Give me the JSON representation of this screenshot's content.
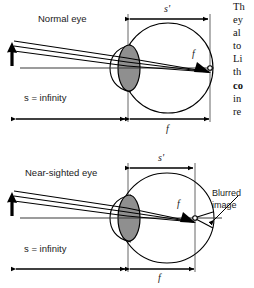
{
  "figure": {
    "type": "optics-diagram",
    "title_absent": true,
    "background_color": "#ffffff",
    "line_color": "#000000",
    "lens_fill_color": "#8c8c8c",
    "dimension_line_color": "#000000",
    "axis_color": "#3a3a3a"
  },
  "panels": [
    {
      "id": "normal-eye",
      "label": "Normal eye",
      "object_distance_label": "s = infinity",
      "image_distance_label": "s'",
      "focal_label_top": "f",
      "focal_label_bottom": "f",
      "focus_on_retina": true,
      "annotation": null
    },
    {
      "id": "near-sighted-eye",
      "label": "Near-sighted eye",
      "object_distance_label": "s = infinity",
      "image_distance_label": "s'",
      "focal_label_top": "f",
      "focal_label_bottom": "f",
      "focus_on_retina": false,
      "annotation": "Blurred\nimage",
      "annotation_line1": "Blurred",
      "annotation_line2": "image"
    }
  ],
  "side_text": {
    "lines": [
      {
        "text": "Th",
        "bold": false
      },
      {
        "text": "ey",
        "bold": false
      },
      {
        "text": "al",
        "bold": false
      },
      {
        "text": "to",
        "bold": false
      },
      {
        "text": "Li",
        "bold": false
      },
      {
        "text": "th",
        "bold": false
      },
      {
        "text": "co",
        "bold": true
      },
      {
        "text": "in",
        "bold": false
      },
      {
        "text": "re",
        "bold": false
      }
    ]
  },
  "labels": {
    "normal_eye": "Normal eye",
    "near_sighted_eye": "Near-sighted eye",
    "s_infinity_top": "s = infinity",
    "s_infinity_bottom": "s = infinity",
    "s_prime_top": "s'",
    "s_prime_bottom": "s'",
    "f_top_inside": "f",
    "f_top_bottom": "f",
    "f_bottom_inside": "f",
    "f_bottom_bottom": "f",
    "blurred": "Blurred",
    "image": "image"
  }
}
